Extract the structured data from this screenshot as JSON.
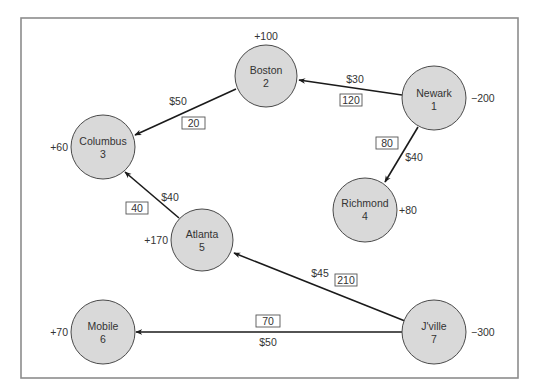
{
  "diagram": {
    "type": "transportation-network",
    "nodes": [
      {
        "id": "1",
        "name": "Newark",
        "supply": "−200"
      },
      {
        "id": "2",
        "name": "Boston",
        "supply": "+100"
      },
      {
        "id": "3",
        "name": "Columbus",
        "supply": "+60"
      },
      {
        "id": "4",
        "name": "Richmond",
        "supply": "+80"
      },
      {
        "id": "5",
        "name": "Atlanta",
        "supply": "+170"
      },
      {
        "id": "6",
        "name": "Mobile",
        "supply": "+70"
      },
      {
        "id": "7",
        "name": "J'ville",
        "supply": "−300"
      }
    ],
    "edges": [
      {
        "from": "Newark",
        "to": "Boston",
        "cost": "$30",
        "flow": "120"
      },
      {
        "from": "Newark",
        "to": "Richmond",
        "cost": "$40",
        "flow": "80"
      },
      {
        "from": "Boston",
        "to": "Columbus",
        "cost": "$50",
        "flow": "20"
      },
      {
        "from": "Atlanta",
        "to": "Columbus",
        "cost": "$40",
        "flow": "40"
      },
      {
        "from": "J'ville",
        "to": "Atlanta",
        "cost": "$45",
        "flow": "210"
      },
      {
        "from": "J'ville",
        "to": "Mobile",
        "cost": "$50",
        "flow": "70"
      }
    ]
  }
}
